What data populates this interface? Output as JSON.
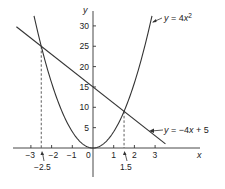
{
  "chart_data": {
    "type": "line",
    "title": "",
    "xlabel": "x",
    "ylabel": "y",
    "xlim": [
      -3.8,
      3.6
    ],
    "ylim": [
      0,
      32
    ],
    "grid": false,
    "x_ticks": [
      -3,
      -2,
      -1,
      0,
      1,
      2,
      3
    ],
    "x_tick_labels": [
      "−3",
      "−2",
      "−1",
      "0",
      "1",
      "2",
      "3"
    ],
    "y_ticks": [
      5,
      10,
      15,
      20,
      25,
      30
    ],
    "y_tick_labels": [
      "5",
      "10",
      "15",
      "20",
      "25",
      "30"
    ],
    "series": [
      {
        "name": "y = 4x²",
        "kind": "parabola",
        "formula": "4*x^2",
        "x_range": [
          -2.85,
          2.85
        ],
        "points": [
          [
            -2.5,
            25
          ],
          [
            -2,
            16
          ],
          [
            -1,
            4
          ],
          [
            0,
            0
          ],
          [
            1,
            4
          ],
          [
            1.5,
            9
          ],
          [
            2,
            16
          ],
          [
            2.5,
            25
          ]
        ]
      },
      {
        "name": "y = −4x + 5",
        "kind": "line",
        "formula": "-4*x+15",
        "x_range": [
          -3.7,
          3.5
        ],
        "points": [
          [
            -3.7,
            29.8
          ],
          [
            -2.5,
            25
          ],
          [
            0,
            15
          ],
          [
            1.5,
            9
          ],
          [
            3.5,
            1
          ]
        ]
      }
    ],
    "annotations": [
      {
        "type": "dashed-vertical",
        "x": -2.5,
        "y_top": 25,
        "label": "−2.5"
      },
      {
        "type": "dashed-vertical",
        "x": 1.5,
        "y_top": 9,
        "label": "1.5"
      },
      {
        "type": "curve-label",
        "series": 0,
        "text": "y = 4x²"
      },
      {
        "type": "curve-label",
        "series": 1,
        "text": "y = −4x + 5"
      }
    ],
    "intersections": [
      [
        -2.5,
        25
      ],
      [
        1.5,
        9
      ]
    ]
  },
  "labels": {
    "x_axis": "x",
    "y_axis": "y",
    "parabola_eq_y": "y",
    "parabola_eq_rest": " = 4",
    "parabola_eq_x": "x",
    "parabola_eq_exp": "2",
    "line_eq_y": "y",
    "line_eq_mid": " = −4",
    "line_eq_x": "x",
    "line_eq_rest": " + 5",
    "intersect_left": "−2.5",
    "intersect_right": "1.5"
  }
}
